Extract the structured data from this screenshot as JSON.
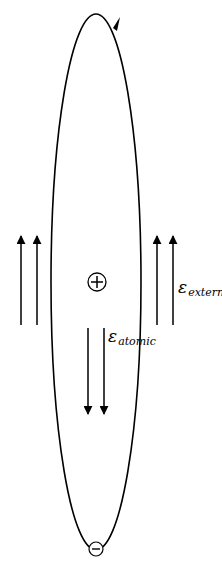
{
  "diagram": {
    "stroke_color": "#000000",
    "background": "#ffffff",
    "nucleus": {
      "symbol": "+",
      "icon": "plus-circle-icon"
    },
    "electron": {
      "symbol": "−",
      "icon": "minus-circle-icon"
    },
    "orbit": {
      "shape": "ellipse",
      "direction_arrow": "counterclockwise-at-top-right"
    },
    "labels": {
      "external_field": {
        "symbol": "ε",
        "subscript": "external"
      },
      "atomic_field": {
        "symbol": "ε",
        "subscript": "atomic"
      }
    },
    "arrows": {
      "external_left": {
        "count": 2,
        "direction": "up"
      },
      "external_right": {
        "count": 2,
        "direction": "up"
      },
      "atomic": {
        "count": 2,
        "direction": "down"
      }
    }
  }
}
